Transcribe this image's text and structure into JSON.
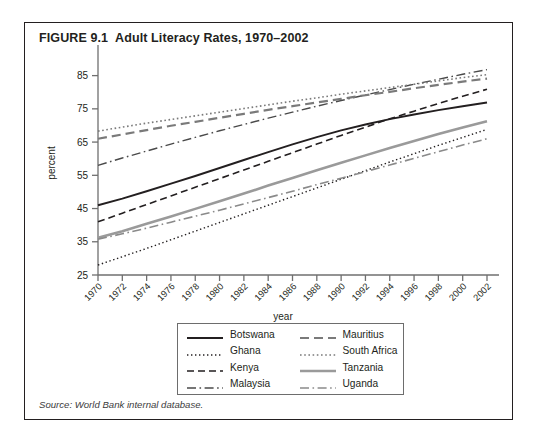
{
  "figure": {
    "number": "FIGURE 9.1",
    "title": "Adult Literacy Rates, 1970–2002",
    "source": "Source: World Bank internal database."
  },
  "axes": {
    "ylabel": "percent",
    "xlabel": "year",
    "yticks": [
      "25",
      "35",
      "45",
      "55",
      "65",
      "75",
      "85"
    ],
    "xticks": [
      "1970",
      "1972",
      "1974",
      "1976",
      "1978",
      "1980",
      "1982",
      "1984",
      "1986",
      "1988",
      "1990",
      "1992",
      "1994",
      "1996",
      "1998",
      "2000",
      "2002"
    ]
  },
  "legend": {
    "items": [
      {
        "label": "Botswana",
        "style": "solid-black"
      },
      {
        "label": "Mauritius",
        "style": "dashed-gray"
      },
      {
        "label": "Ghana",
        "style": "dotted-black"
      },
      {
        "label": "South Africa",
        "style": "dotted-gray"
      },
      {
        "label": "Kenya",
        "style": "dashed-black"
      },
      {
        "label": "Tanzania",
        "style": "solid-gray-thick"
      },
      {
        "label": "Malaysia",
        "style": "dashdot-black"
      },
      {
        "label": "Uganda",
        "style": "dashdot-gray"
      }
    ]
  },
  "chart_data": {
    "type": "line",
    "title": "Adult Literacy Rates, 1970–2002",
    "xlabel": "year",
    "ylabel": "percent",
    "xlim": [
      1970,
      2002
    ],
    "ylim": [
      25,
      90
    ],
    "grid": false,
    "legend_position": "below-plot",
    "x": [
      1970,
      1972,
      1974,
      1976,
      1978,
      1980,
      1982,
      1984,
      1986,
      1988,
      1990,
      1992,
      1994,
      1996,
      1998,
      2000,
      2002
    ],
    "series": [
      {
        "name": "Botswana",
        "style": "solid-black",
        "color": "#231f20",
        "width": 1.9,
        "values": [
          46.0,
          48.0,
          50.2,
          52.5,
          54.8,
          57.2,
          59.6,
          62.0,
          64.3,
          66.5,
          68.5,
          70.3,
          71.9,
          73.3,
          74.6,
          75.8,
          76.9
        ]
      },
      {
        "name": "Ghana",
        "style": "dotted-black",
        "color": "#231f20",
        "width": 1.4,
        "values": [
          28.0,
          30.5,
          33.0,
          35.6,
          38.2,
          40.8,
          43.4,
          46.0,
          48.6,
          51.2,
          53.8,
          56.4,
          59.0,
          61.5,
          64.0,
          66.4,
          68.8
        ]
      },
      {
        "name": "Kenya",
        "style": "dashed-black",
        "color": "#231f20",
        "width": 1.6,
        "values": [
          41.0,
          43.6,
          46.2,
          48.8,
          51.4,
          54.0,
          56.6,
          59.2,
          61.8,
          64.4,
          67.0,
          69.5,
          72.0,
          74.3,
          76.6,
          78.8,
          80.9
        ]
      },
      {
        "name": "Malaysia",
        "style": "dashdot-black",
        "color": "#4a4a4a",
        "width": 1.4,
        "values": [
          58.0,
          60.2,
          62.3,
          64.4,
          66.4,
          68.4,
          70.3,
          72.2,
          74.0,
          75.8,
          77.5,
          79.2,
          80.8,
          82.4,
          83.9,
          85.4,
          86.8
        ]
      },
      {
        "name": "Mauritius",
        "style": "dashed-gray",
        "color": "#7a7a7a",
        "width": 2.2,
        "values": [
          66.0,
          67.3,
          68.6,
          69.9,
          71.1,
          72.3,
          73.5,
          74.7,
          75.8,
          76.9,
          78.0,
          79.1,
          80.1,
          81.2,
          82.2,
          83.2,
          84.1
        ]
      },
      {
        "name": "South Africa",
        "style": "dotted-gray",
        "color": "#7a7a7a",
        "width": 1.6,
        "values": [
          68.3,
          69.5,
          70.7,
          71.8,
          72.9,
          74.0,
          75.1,
          76.2,
          77.3,
          78.3,
          79.4,
          80.4,
          81.4,
          82.4,
          83.4,
          84.4,
          85.3
        ]
      },
      {
        "name": "Tanzania",
        "style": "solid-gray-thick",
        "color": "#9a9a9a",
        "width": 2.6,
        "values": [
          36.2,
          38.2,
          40.4,
          42.6,
          44.9,
          47.2,
          49.5,
          51.9,
          54.2,
          56.5,
          58.8,
          61.0,
          63.2,
          65.3,
          67.4,
          69.4,
          71.3
        ]
      },
      {
        "name": "Uganda",
        "style": "dashdot-gray",
        "color": "#8a8a8a",
        "width": 1.6,
        "values": [
          35.8,
          37.4,
          39.1,
          40.9,
          42.7,
          44.5,
          46.4,
          48.3,
          50.2,
          52.2,
          54.1,
          56.1,
          58.1,
          60.1,
          62.1,
          64.1,
          66.0
        ]
      }
    ]
  }
}
